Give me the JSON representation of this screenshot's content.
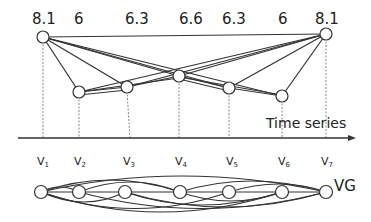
{
  "time_series": {
    "label": "Time series",
    "values": [
      "8.1",
      "6",
      "6.3",
      "6.6",
      "6.3",
      "6",
      "8.1"
    ]
  },
  "vertices": [
    {
      "base": "V",
      "sub": "1"
    },
    {
      "base": "V",
      "sub": "2"
    },
    {
      "base": "V",
      "sub": "3"
    },
    {
      "base": "V",
      "sub": "4"
    },
    {
      "base": "V",
      "sub": "5"
    },
    {
      "base": "V",
      "sub": "6"
    },
    {
      "base": "V",
      "sub": "7"
    }
  ],
  "graph_label": "VG",
  "colors": {
    "line": "#333333",
    "dashed": "#777777",
    "node_fill": "#ffffff"
  }
}
